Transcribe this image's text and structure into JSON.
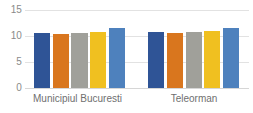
{
  "chart_data": {
    "type": "bar",
    "title": "",
    "subtitle": "",
    "xlabel": "",
    "ylabel": "",
    "categories": [
      "Municipiul Bucuresti",
      "Teleorman"
    ],
    "ylim": [
      0,
      15
    ],
    "yticks": [
      0,
      5,
      10,
      15
    ],
    "ytick_labels": [
      "0",
      "5",
      "10",
      "15"
    ],
    "grid": true,
    "legend": "none",
    "series": [
      {
        "name": "series-1",
        "color": "#2F5496",
        "values": [
          10.6,
          10.8
        ]
      },
      {
        "name": "series-2",
        "color": "#D9761E",
        "values": [
          10.3,
          10.5
        ]
      },
      {
        "name": "series-3",
        "color": "#A0A09A",
        "values": [
          10.6,
          10.8
        ]
      },
      {
        "name": "series-4",
        "color": "#F0C020",
        "values": [
          10.8,
          11.0
        ]
      },
      {
        "name": "series-5",
        "color": "#4E81BD",
        "values": [
          11.5,
          11.6
        ]
      }
    ]
  },
  "axis": {
    "y_ticks": [
      {
        "label": "15",
        "value": 15
      },
      {
        "label": "10",
        "value": 10
      },
      {
        "label": "5",
        "value": 5
      },
      {
        "label": "0",
        "value": 0
      }
    ],
    "x_categories": [
      {
        "label": "Municipiul Bucuresti"
      },
      {
        "label": "Teleorman"
      }
    ]
  },
  "colors": {
    "series_1": "#2F5496",
    "series_2": "#D9761E",
    "series_3": "#A0A09A",
    "series_4": "#F0C020",
    "series_5": "#4E81BD",
    "gridline": "#E2E2E2",
    "tick_text": "#8A8A8A",
    "category_text": "#6F6F6F",
    "background": "#FFFFFF"
  }
}
